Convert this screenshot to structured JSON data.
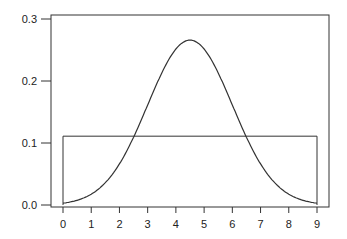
{
  "chart_data": {
    "type": "line",
    "title": "",
    "xlabel": "",
    "ylabel": "",
    "xlim": [
      0,
      9
    ],
    "ylim": [
      0.0,
      0.3
    ],
    "x_ticks": [
      "0",
      "1",
      "2",
      "3",
      "4",
      "5",
      "6",
      "7",
      "8",
      "9"
    ],
    "y_ticks": [
      "0.0",
      "0.1",
      "0.2",
      "0.3"
    ],
    "grid": false,
    "legend": null,
    "series": [
      {
        "name": "normal density (mean 4.5, sd 1.5)",
        "style": "curve",
        "x": [
          0,
          0.5,
          1,
          1.5,
          2,
          2.5,
          3,
          3.5,
          4,
          4.5,
          5,
          5.5,
          6,
          6.5,
          7,
          7.5,
          8,
          8.5,
          9
        ],
        "values": [
          0.003,
          0.006,
          0.011,
          0.018,
          0.026,
          0.037,
          0.048,
          0.061,
          0.071,
          0.077,
          0.071,
          0.061,
          0.048,
          0.037,
          0.026,
          0.018,
          0.011,
          0.006,
          0.003
        ]
      },
      {
        "name": "uniform density",
        "style": "step",
        "x": [
          0,
          9
        ],
        "values": [
          0.111,
          0.111
        ]
      }
    ],
    "peak": {
      "x": 4.5,
      "y": 0.266
    }
  }
}
